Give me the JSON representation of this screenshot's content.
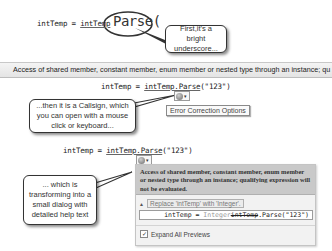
{
  "panel1": {
    "code_prefix": "intTemp = ",
    "code_underlined": "intTemp",
    "magnified_text": "Parse(",
    "callout_text": "First,it's a bright underscore..."
  },
  "error_bar": {
    "text": "Access of shared member, constant member, enum member or nested type through an instance; qu"
  },
  "panel2": {
    "code_prefix": "intTemp = ",
    "code_underlined": "intTemp.Parse",
    "code_suffix": "(\"123\")",
    "smart_tag_icon": "error-correction-icon",
    "smart_tag_arrow": "▾",
    "tooltip": "Error Correction Options",
    "callout_text": "...then it is a Callsign, which you can open with a mouse click or keyboard..."
  },
  "panel3": {
    "code_prefix": "intTemp = ",
    "code_underlined": "intTemp.Parse",
    "code_suffix": "(\"123\")",
    "smart_tag_arrow": "▾",
    "callout_text": "... which is transforming into a small dialog with detailed help text",
    "dialog": {
      "message": "Access of shared member, constant member, enum member or nested type through an instance; qualifying expression will not be evaluated.",
      "fix_expander": "▲",
      "fix_label": "Replace 'intTemp' with 'Integer'.",
      "preview_prefix": "intTemp = ",
      "preview_new": "Integer",
      "preview_old": "intTemp",
      "preview_suffix": ".Parse(\"123\")",
      "expand_checkbox_checked": "✓",
      "expand_label": "Expand All Previews"
    }
  }
}
